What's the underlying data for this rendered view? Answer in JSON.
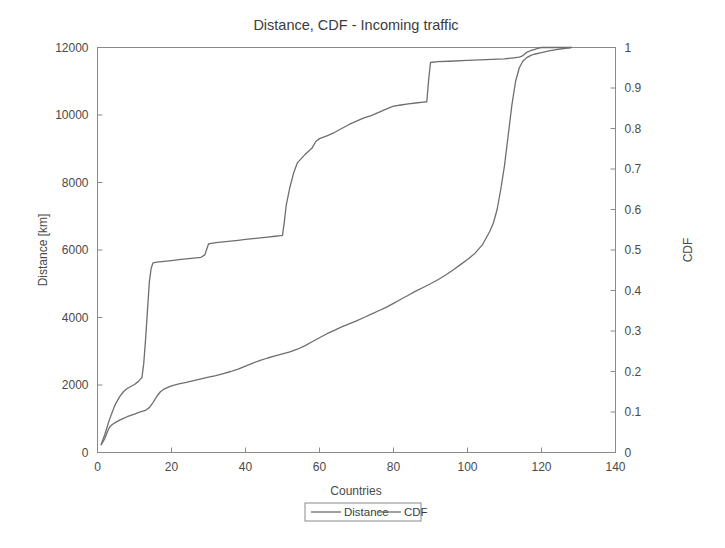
{
  "chart_data": {
    "type": "line",
    "title": "Distance, CDF - Incoming traffic",
    "xlabel": "Countries",
    "ylabel": "Distance [km]",
    "y2label": "CDF",
    "xlim": [
      0,
      140
    ],
    "ylim": [
      0,
      12000
    ],
    "y2lim": [
      0,
      1
    ],
    "grid": false,
    "legend_position": "below-axes-center",
    "xticks": [
      0,
      20,
      40,
      60,
      80,
      100,
      120,
      140
    ],
    "xtick_labels": [
      "0",
      "20",
      "40",
      "60",
      "80",
      "100",
      "120",
      "140"
    ],
    "yticks": [
      0,
      2000,
      4000,
      6000,
      8000,
      10000,
      12000
    ],
    "ytick_labels": [
      "0",
      "2000",
      "4000",
      "6000",
      "8000",
      "10000",
      "12000"
    ],
    "y2ticks": [
      0,
      0.1,
      0.2,
      0.3,
      0.4,
      0.5,
      0.6,
      0.7,
      0.8,
      0.9,
      1
    ],
    "y2tick_labels": [
      "0",
      "0.1",
      "0.2",
      "0.3",
      "0.4",
      "0.5",
      "0.6",
      "0.7",
      "0.8",
      "0.9",
      "1"
    ],
    "line_color": "#6e6e6e",
    "series": [
      {
        "name": "Distance",
        "axis": "left",
        "color": "#6e6e6e",
        "x": [
          1,
          2,
          2.5,
          3,
          3.5,
          4,
          5,
          6,
          7,
          8,
          9,
          10,
          11,
          12,
          13,
          14,
          15,
          16,
          17,
          18,
          19,
          20,
          22,
          24,
          26,
          28,
          30,
          32,
          34,
          36,
          38,
          40,
          42,
          44,
          46,
          48,
          50,
          52,
          54,
          56,
          58,
          60,
          62,
          64,
          66,
          68,
          70,
          72,
          74,
          76,
          78,
          80,
          82,
          84,
          86,
          88,
          90,
          92,
          94,
          96,
          98,
          100,
          102,
          104,
          105,
          106,
          107,
          108,
          109,
          110,
          111,
          112,
          113,
          114,
          115,
          116,
          117,
          118,
          120,
          122,
          124,
          126,
          128
        ],
        "y": [
          230,
          420,
          560,
          700,
          780,
          830,
          900,
          960,
          1010,
          1060,
          1100,
          1140,
          1180,
          1215,
          1250,
          1330,
          1480,
          1660,
          1800,
          1880,
          1930,
          1975,
          2030,
          2080,
          2130,
          2180,
          2230,
          2280,
          2340,
          2400,
          2470,
          2560,
          2650,
          2730,
          2800,
          2860,
          2920,
          2980,
          3060,
          3160,
          3280,
          3400,
          3520,
          3620,
          3720,
          3810,
          3900,
          4000,
          4100,
          4200,
          4300,
          4420,
          4540,
          4660,
          4780,
          4890,
          5000,
          5120,
          5250,
          5400,
          5560,
          5720,
          5900,
          6150,
          6350,
          6550,
          6800,
          7200,
          7800,
          8500,
          9400,
          10300,
          11000,
          11400,
          11600,
          11700,
          11760,
          11800,
          11850,
          11900,
          11940,
          11970,
          12000
        ]
      },
      {
        "name": "CDF",
        "axis": "right",
        "color": "#6e6e6e",
        "x": [
          1,
          2,
          2.5,
          3,
          3.5,
          4,
          4.5,
          5,
          5.5,
          6,
          7,
          8,
          9,
          10,
          11,
          12,
          12.5,
          13,
          13.5,
          14,
          14.5,
          15,
          16,
          18,
          20,
          22,
          24,
          26,
          28,
          29,
          30,
          32,
          34,
          36,
          38,
          40,
          42,
          44,
          46,
          48,
          49,
          50,
          50.5,
          51,
          52,
          53,
          54,
          56,
          58,
          59,
          60,
          62,
          64,
          66,
          68,
          70,
          72,
          74,
          76,
          78,
          80,
          82,
          84,
          86,
          88,
          89,
          89.5,
          90,
          92,
          95,
          100,
          105,
          110,
          112,
          114,
          115,
          116,
          117,
          118,
          119,
          120,
          122,
          125,
          128
        ],
        "y": [
          0.02,
          0.045,
          0.06,
          0.075,
          0.088,
          0.1,
          0.112,
          0.122,
          0.13,
          0.138,
          0.15,
          0.158,
          0.163,
          0.168,
          0.175,
          0.185,
          0.22,
          0.28,
          0.35,
          0.42,
          0.455,
          0.468,
          0.47,
          0.472,
          0.474,
          0.476,
          0.478,
          0.48,
          0.482,
          0.488,
          0.515,
          0.518,
          0.52,
          0.522,
          0.524,
          0.526,
          0.528,
          0.53,
          0.532,
          0.534,
          0.535,
          0.536,
          0.57,
          0.61,
          0.655,
          0.69,
          0.715,
          0.735,
          0.752,
          0.768,
          0.775,
          0.782,
          0.79,
          0.8,
          0.81,
          0.818,
          0.826,
          0.832,
          0.84,
          0.848,
          0.855,
          0.858,
          0.861,
          0.863,
          0.865,
          0.866,
          0.92,
          0.963,
          0.965,
          0.966,
          0.968,
          0.97,
          0.972,
          0.974,
          0.976,
          0.98,
          0.988,
          0.992,
          0.995,
          0.998,
          1.0,
          1.0,
          1.0,
          1.0
        ]
      }
    ]
  },
  "legend": {
    "entries": [
      {
        "label": "Distance"
      },
      {
        "label": "CDF"
      }
    ]
  }
}
